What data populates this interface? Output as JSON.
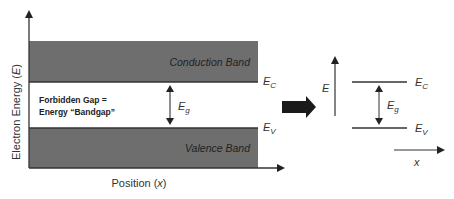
{
  "diagram": {
    "left": {
      "y_axis_label": "Electron Energy (",
      "y_axis_var": "E",
      "y_axis_close": ")",
      "x_axis_label": "Position (",
      "x_axis_var": "x",
      "x_axis_close": ")",
      "conduction_band_label": "Conduction Band",
      "valence_band_label": "Valence Band",
      "gap_label_line1": "Forbidden Gap =",
      "gap_label_line2": "Energy “Bandgap”",
      "eg_symbol": "E",
      "eg_subscript": "g",
      "ec_symbol": "E",
      "ec_subscript": "C",
      "ev_symbol": "E",
      "ev_subscript": "V"
    },
    "transition_arrow": "block-right-arrow",
    "right": {
      "e_axis_label": "E",
      "x_axis_label": "x",
      "eg_symbol": "E",
      "eg_subscript": "g",
      "ec_symbol": "E",
      "ec_subscript": "C",
      "ev_symbol": "E",
      "ev_subscript": "V"
    },
    "colors": {
      "band_fill": "#6e6e6e",
      "line": "#333333",
      "arrow": "#222222",
      "background": "#ffffff"
    }
  }
}
